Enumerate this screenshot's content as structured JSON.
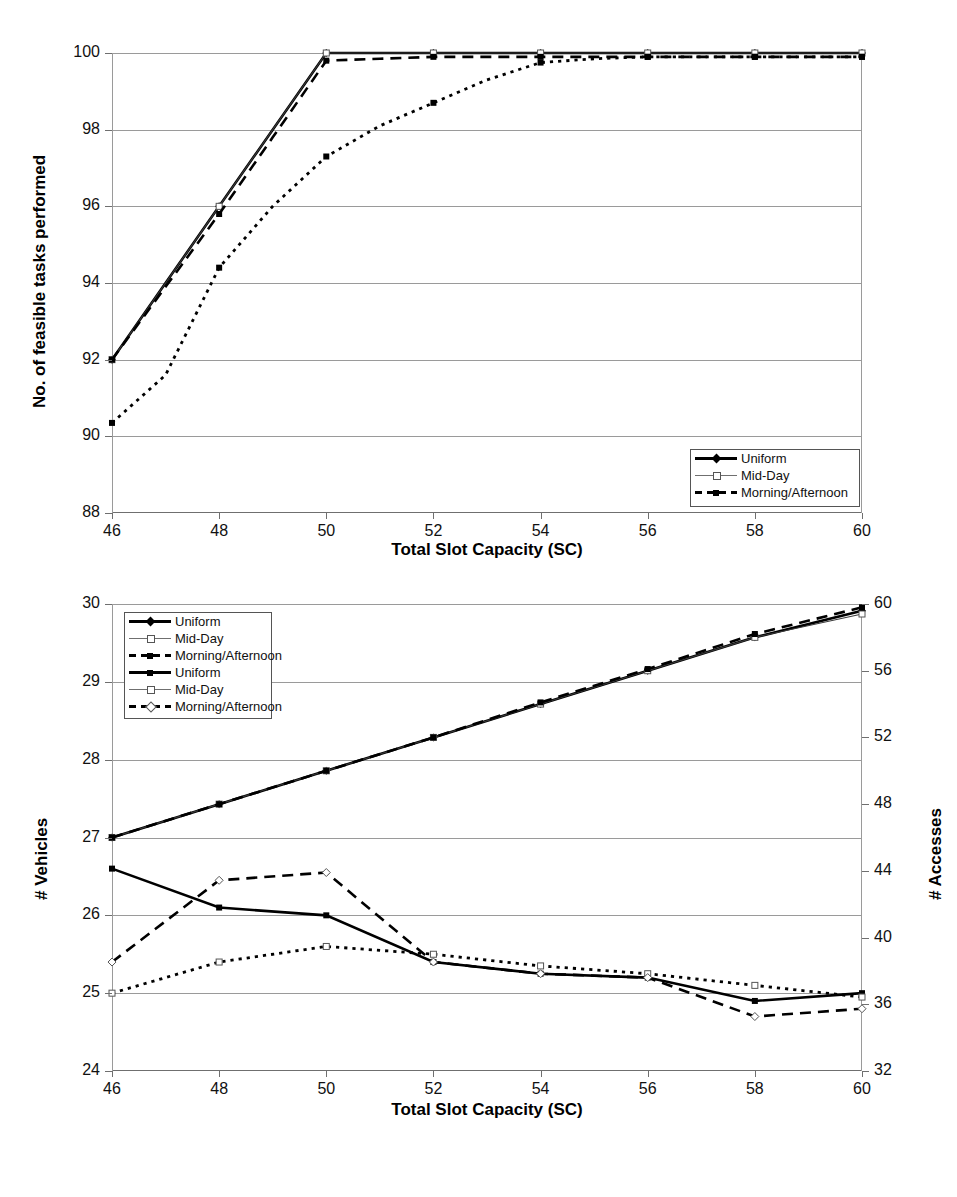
{
  "figure": {
    "charts": [
      {
        "id": "chart-top",
        "type": "line",
        "title": "",
        "xlabel": "Total Slot Capacity (SC)",
        "ylabel": "No. of feasible tasks performed",
        "xlim": [
          46,
          60
        ],
        "ylim": [
          88,
          100
        ],
        "xticks": [
          46,
          48,
          50,
          52,
          54,
          56,
          58,
          60
        ],
        "yticks": [
          88,
          90,
          92,
          94,
          96,
          98,
          100
        ],
        "grid": true,
        "legend_position": "bottom-right",
        "x": [
          46,
          47,
          48,
          49,
          50,
          51,
          52,
          53,
          54,
          55,
          56,
          57,
          58,
          59,
          60
        ],
        "series": [
          {
            "name": "Uniform",
            "style": "solid-thick",
            "marker": "diamond",
            "values": [
              92.0,
              94.0,
              96.0,
              98.0,
              100.0,
              100.0,
              100.0,
              100.0,
              100.0,
              100.0,
              100.0,
              100.0,
              100.0,
              100.0,
              100.0
            ]
          },
          {
            "name": "Mid-Day",
            "style": "solid-thin",
            "marker": "open-square",
            "values": [
              92.0,
              94.0,
              96.0,
              98.0,
              100.0,
              100.0,
              100.0,
              100.0,
              100.0,
              100.0,
              100.0,
              100.0,
              100.0,
              100.0,
              100.0
            ]
          },
          {
            "name": "Morning/Afternoon",
            "style": "dashed",
            "marker": "square",
            "values": [
              92.0,
              93.9,
              95.8,
              97.8,
              99.8,
              99.85,
              99.9,
              99.9,
              99.9,
              99.9,
              99.9,
              99.9,
              99.9,
              99.9,
              99.9
            ]
          },
          {
            "name": "Morning/Afternoon-dotted",
            "style": "dotted",
            "marker": "square",
            "values": [
              90.35,
              91.6,
              94.4,
              96.0,
              97.3,
              98.1,
              98.7,
              99.3,
              99.75,
              99.85,
              99.9,
              99.9,
              99.9,
              99.9,
              99.9
            ]
          }
        ],
        "legend": [
          {
            "label": "Uniform",
            "style": "solid-thick",
            "marker": "diamond"
          },
          {
            "label": "Mid-Day",
            "style": "solid-thin",
            "marker": "open-square"
          },
          {
            "label": "Morning/Afternoon",
            "style": "dashed",
            "marker": "square"
          }
        ]
      },
      {
        "id": "chart-bottom",
        "type": "line",
        "title": "",
        "xlabel": "Total Slot Capacity (SC)",
        "ylabel": "# Vehicles",
        "y2label": "# Accesses",
        "xlim": [
          46,
          60
        ],
        "ylim": [
          24,
          30
        ],
        "y2lim": [
          32,
          60
        ],
        "xticks": [
          46,
          48,
          50,
          52,
          54,
          56,
          58,
          60
        ],
        "yticks": [
          24,
          25,
          26,
          27,
          28,
          29,
          30
        ],
        "y2ticks": [
          32,
          36,
          40,
          44,
          48,
          52,
          56,
          60
        ],
        "grid": true,
        "legend_position": "top-left",
        "x": [
          46,
          48,
          50,
          52,
          54,
          56,
          58,
          60
        ],
        "series": [
          {
            "name": "Uniform",
            "axis": "right",
            "style": "solid-thick",
            "marker": "diamond",
            "values": [
              46.0,
              48.0,
              50.0,
              52.0,
              54.0,
              56.0,
              58.0,
              59.6
            ]
          },
          {
            "name": "Mid-Day",
            "axis": "right",
            "style": "solid-thin",
            "marker": "open-square",
            "values": [
              46.0,
              48.0,
              50.0,
              52.0,
              54.0,
              56.0,
              58.0,
              59.4
            ]
          },
          {
            "name": "Morning/Afternoon",
            "axis": "right",
            "style": "dashed",
            "marker": "square",
            "values": [
              46.0,
              48.0,
              50.0,
              52.0,
              54.1,
              56.1,
              58.2,
              59.8
            ]
          },
          {
            "name": "Uniform",
            "axis": "left",
            "style": "solid-thick",
            "marker": "square",
            "values": [
              26.6,
              26.1,
              26.0,
              25.4,
              25.25,
              25.2,
              24.9,
              25.0
            ]
          },
          {
            "name": "Mid-Day",
            "axis": "left",
            "style": "dotted",
            "marker": "open-square",
            "values": [
              25.0,
              25.4,
              25.6,
              25.5,
              25.35,
              25.25,
              25.1,
              24.95
            ]
          },
          {
            "name": "Morning/Afternoon",
            "axis": "left",
            "style": "dashed",
            "marker": "open-diamond",
            "values": [
              25.4,
              26.45,
              26.55,
              25.4,
              25.25,
              25.2,
              24.7,
              24.8
            ]
          }
        ],
        "legend": [
          {
            "label": "Uniform",
            "style": "solid-thick",
            "marker": "diamond"
          },
          {
            "label": "Mid-Day",
            "style": "solid-thin",
            "marker": "open-square"
          },
          {
            "label": "Morning/Afternoon",
            "style": "dashed",
            "marker": "square"
          },
          {
            "label": "Uniform",
            "style": "solid-thick",
            "marker": "square"
          },
          {
            "label": "Mid-Day",
            "style": "solid-thin",
            "marker": "open-square"
          },
          {
            "label": "Morning/Afternoon",
            "style": "dashed",
            "marker": "open-diamond"
          }
        ]
      }
    ],
    "colors": {
      "line": "#000000",
      "grid": "#9a9a9a",
      "axis": "#6f6f6f",
      "background": "#ffffff"
    }
  }
}
